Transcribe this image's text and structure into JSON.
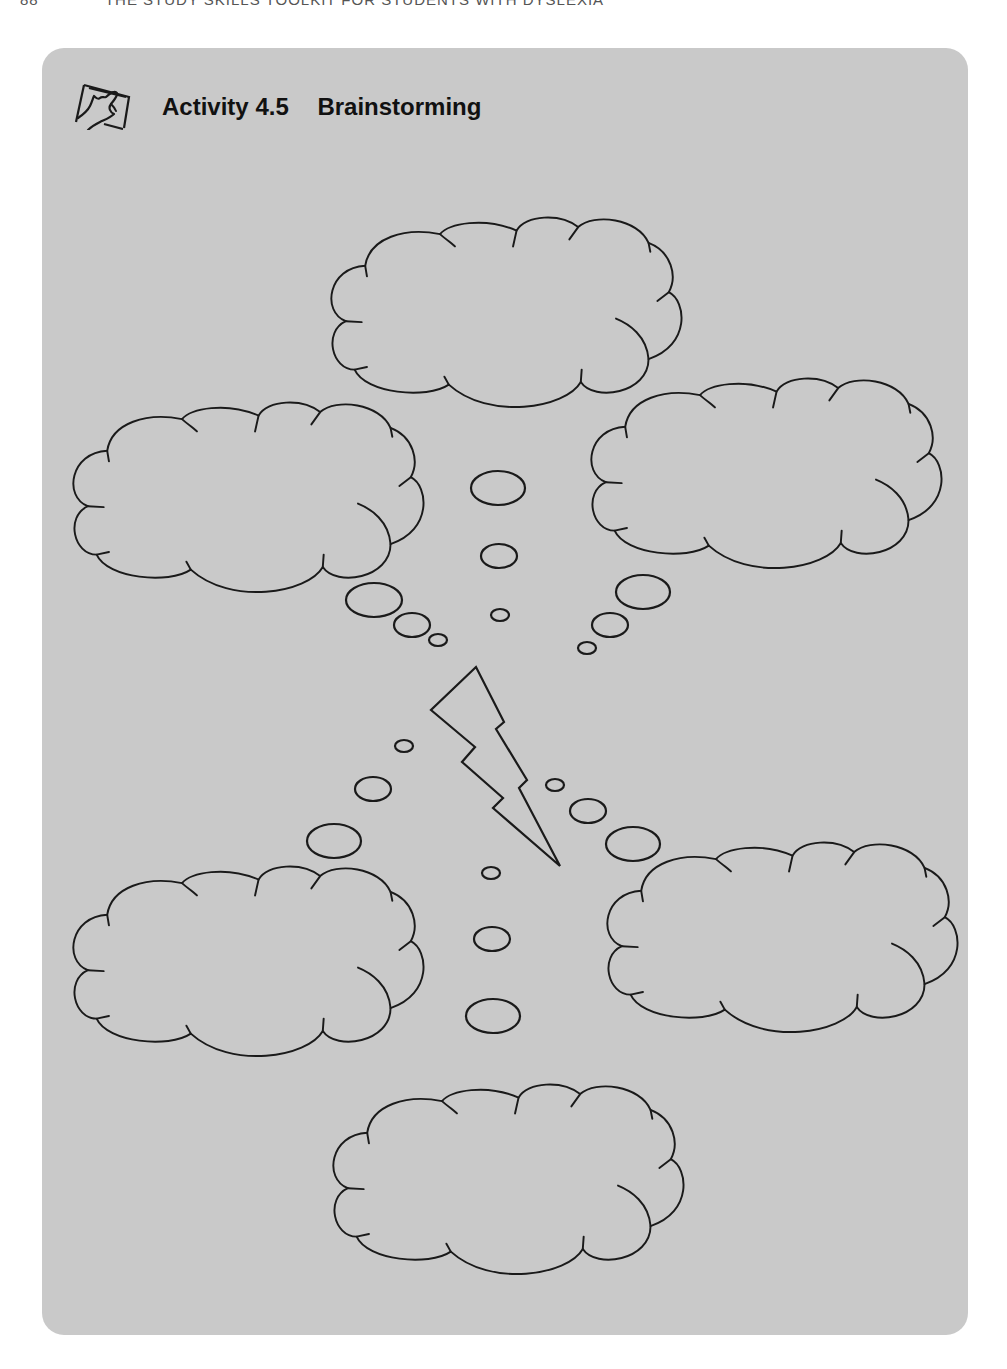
{
  "page": {
    "running_head": {
      "page_number": "88",
      "title": "THE STUDY SKILLS TOOLKIT FOR STUDENTS WITH DYSLEXIA"
    }
  },
  "activity": {
    "label": "Activity",
    "number": "4.5",
    "title": "Brainstorming",
    "icon": "hand-touching-screen-icon"
  },
  "diagram": {
    "clouds": [
      {
        "name": "cloud-top",
        "text": ""
      },
      {
        "name": "cloud-upper-left",
        "text": ""
      },
      {
        "name": "cloud-upper-right",
        "text": ""
      },
      {
        "name": "cloud-lower-left",
        "text": ""
      },
      {
        "name": "cloud-lower-right",
        "text": ""
      },
      {
        "name": "cloud-bottom",
        "text": ""
      }
    ],
    "center_symbol": "lightning-bolt-icon",
    "colors": {
      "panel": "#c9c9c9",
      "stroke": "#1a1a1a"
    }
  }
}
